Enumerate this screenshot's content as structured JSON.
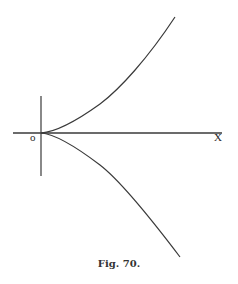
{
  "figure": {
    "caption": "Fig. 70.",
    "origin_label": "o",
    "x_axis_label": "X",
    "colors": {
      "ink": "#3a3a3a",
      "background": "#ffffff"
    }
  },
  "diagram": {
    "type": "curve-with-cusp",
    "elements": [
      {
        "id": "x-axis",
        "kind": "line",
        "from": [
          13,
          133
        ],
        "to": [
          222,
          133
        ]
      },
      {
        "id": "y-axis",
        "kind": "line",
        "from": [
          41,
          96
        ],
        "to": [
          41,
          176
        ]
      },
      {
        "id": "upper-branch",
        "kind": "curve",
        "points": [
          [
            41,
            133
          ],
          [
            60,
            130
          ],
          [
            100,
            104
          ],
          [
            140,
            64
          ],
          [
            175,
            17
          ]
        ]
      },
      {
        "id": "lower-branch",
        "kind": "curve",
        "points": [
          [
            41,
            133
          ],
          [
            60,
            137
          ],
          [
            100,
            165
          ],
          [
            142,
            210
          ],
          [
            180,
            257
          ]
        ]
      }
    ]
  }
}
